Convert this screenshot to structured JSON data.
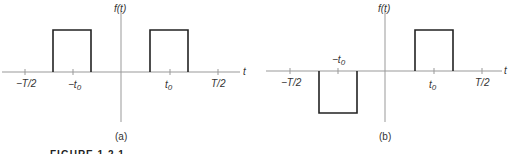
{
  "figure_caption": "FIGURE 1.2.1",
  "panels": [
    {
      "id": "a",
      "caption": "(a)",
      "ylabel": "f(t)",
      "xlabel": "t",
      "ticks": [
        "−T/2",
        "−t0",
        "t0",
        "T/2"
      ],
      "description": "Two positive rectangular pulses centered at −t0 and t0"
    },
    {
      "id": "b",
      "caption": "(b)",
      "ylabel": "f(t)",
      "xlabel": "t",
      "ticks": [
        "−T/2",
        "−t0",
        "t0",
        "T/2"
      ],
      "description": "Negative rectangular pulse centered at −t0 and positive pulse centered at t0"
    }
  ]
}
